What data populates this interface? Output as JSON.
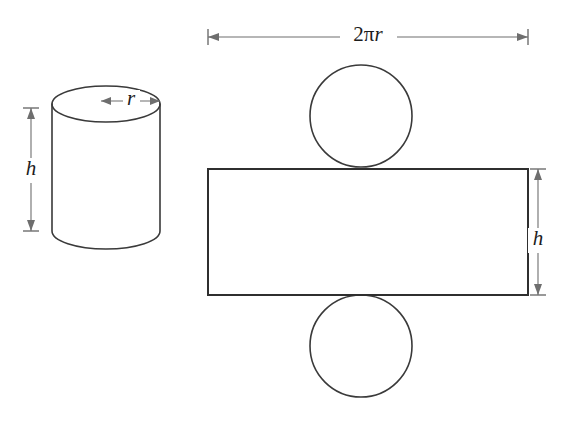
{
  "figure": {
    "background_color": "#ffffff",
    "line_color": "#3a3a3a",
    "dimension_line_color": "#6e6e6e",
    "label_color": "#1c1c1c",
    "width_px": 576,
    "height_px": 423
  },
  "labels": {
    "cylinder_height": "h",
    "cylinder_radius": "r",
    "net_rectangle_width": "2πr",
    "net_rectangle_width_prefix": "2π",
    "net_rectangle_width_variable": "r",
    "net_rectangle_height": "h"
  },
  "shapes": {
    "cylinder": {
      "name": "cylinder",
      "center_x": 106,
      "top_ellipse_cy": 104,
      "rx": 54,
      "ry": 18,
      "body_top_y": 104,
      "body_bottom_y": 231,
      "height_px": 127
    },
    "net_rectangle": {
      "name": "net-rectangle",
      "x": 208,
      "y": 169,
      "width": 320,
      "height": 126
    },
    "net_circle_top": {
      "name": "net-circle-top",
      "cx": 361,
      "cy": 116,
      "r": 51
    },
    "net_circle_bottom": {
      "name": "net-circle-bottom",
      "cx": 361,
      "cy": 346,
      "r": 51
    }
  },
  "dimensions": {
    "cylinder_height_arrow": {
      "name": "cylinder-height-dimension",
      "x": 31,
      "y_top": 108,
      "y_bottom": 231,
      "label": "h",
      "label_y": 170
    },
    "cylinder_radius_arrow": {
      "name": "cylinder-radius-dimension",
      "y": 101,
      "x_left": 101,
      "x_right": 160,
      "label": "r",
      "label_x": 131
    },
    "net_width_arrow": {
      "name": "net-width-dimension",
      "y": 37,
      "x_left": 208,
      "x_right": 528,
      "label": "2πr",
      "label_x": 368
    },
    "net_height_arrow": {
      "name": "net-height-dimension",
      "x": 538,
      "y_top": 169,
      "y_bottom": 295,
      "label": "h",
      "label_y": 240
    }
  }
}
